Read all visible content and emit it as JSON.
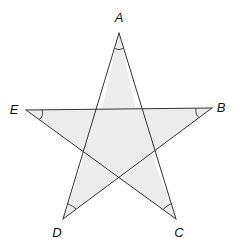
{
  "diagram": {
    "type": "pentagram",
    "fill_color": "#ececec",
    "stroke_color": "#333333",
    "vertices": [
      {
        "name": "A",
        "x": 119,
        "y": 33,
        "label": "A",
        "label_x": 119,
        "label_y": 22
      },
      {
        "name": "B",
        "x": 212,
        "y": 108,
        "label": "B",
        "label_x": 221,
        "label_y": 112
      },
      {
        "name": "C",
        "x": 176,
        "y": 219,
        "label": "C",
        "label_x": 179,
        "label_y": 237
      },
      {
        "name": "D",
        "x": 63,
        "y": 219,
        "label": "D",
        "label_x": 57,
        "label_y": 237
      },
      {
        "name": "E",
        "x": 26,
        "y": 110,
        "label": "E",
        "label_x": 14,
        "label_y": 114
      }
    ],
    "edges": [
      [
        "A",
        "C"
      ],
      [
        "C",
        "E"
      ],
      [
        "E",
        "B"
      ],
      [
        "B",
        "D"
      ],
      [
        "D",
        "A"
      ]
    ],
    "marked_angles": [
      "A",
      "B",
      "C",
      "D",
      "E"
    ],
    "labels": {
      "A": "A",
      "B": "B",
      "C": "C",
      "D": "D",
      "E": "E"
    }
  }
}
